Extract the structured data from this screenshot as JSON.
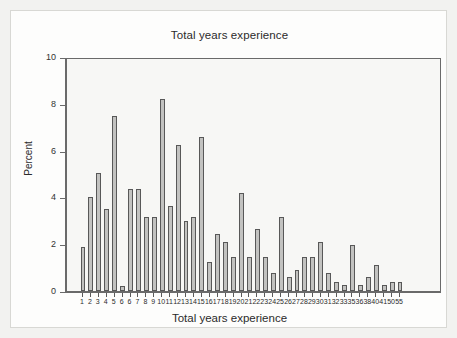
{
  "figure": {
    "title": "Total years experience",
    "x_axis_title": "Total years experience",
    "y_axis_title": "Percent"
  },
  "chart_data": {
    "type": "bar",
    "title": "Total years experience",
    "xlabel": "Total years experience",
    "ylabel": "Percent",
    "ylim": [
      0,
      10
    ],
    "yticks": [
      0,
      2,
      4,
      6,
      8,
      10
    ],
    "grid": false,
    "legend": null,
    "bar_color": "#c2c2c0",
    "bar_edge_color": "#585858",
    "plot_background": "#f7f7f5",
    "categories": [
      "1",
      "2",
      "3",
      "4",
      "5",
      "6",
      "6",
      "7",
      "8",
      "9",
      "10",
      "11",
      "12",
      "13",
      "14",
      "15",
      "16",
      "17",
      "18",
      "19",
      "20",
      "21",
      "22",
      "23",
      "24",
      "25",
      "26",
      "27",
      "28",
      "29",
      "30",
      "31",
      "32",
      "33",
      "35",
      "36",
      "38",
      "40",
      "41",
      "50",
      "55"
    ],
    "values": [
      1.9,
      4.0,
      5.05,
      3.5,
      7.5,
      0.2,
      4.35,
      4.35,
      3.15,
      3.15,
      8.2,
      3.65,
      6.25,
      3.0,
      3.15,
      6.6,
      1.25,
      2.45,
      2.1,
      1.45,
      4.2,
      1.45,
      2.65,
      1.45,
      0.75,
      3.15,
      0.6,
      0.9,
      1.45,
      1.45,
      2.1,
      0.75,
      0.4,
      0.25,
      1.95,
      0.25,
      0.6,
      1.1,
      0.25,
      0.4,
      0.4
    ]
  }
}
